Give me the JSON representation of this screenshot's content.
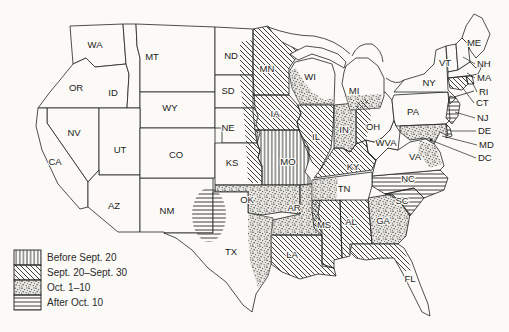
{
  "legend": {
    "items": [
      {
        "pattern": "vertical",
        "label": "Before Sept. 20"
      },
      {
        "pattern": "diagonal",
        "label": "Sept. 20–Sept. 30"
      },
      {
        "pattern": "stipple",
        "label": "Oct. 1–10"
      },
      {
        "pattern": "horizontal",
        "label": "After Oct. 10"
      }
    ]
  },
  "colors": {
    "line": "#222222",
    "paper": "#fbfaf7",
    "stipple_dot": "#3c3c3c"
  },
  "map": {
    "states": {
      "WA": {
        "label": "WA",
        "pattern": "none"
      },
      "OR": {
        "label": "OR",
        "pattern": "none"
      },
      "ID": {
        "label": "ID",
        "pattern": "none"
      },
      "MT": {
        "label": "MT",
        "pattern": "none"
      },
      "WY": {
        "label": "WY",
        "pattern": "none"
      },
      "NV": {
        "label": "NV",
        "pattern": "none"
      },
      "UT": {
        "label": "UT",
        "pattern": "none"
      },
      "CA": {
        "label": "CA",
        "pattern": "none"
      },
      "AZ": {
        "label": "AZ",
        "pattern": "none"
      },
      "NM": {
        "label": "NM",
        "pattern": "none"
      },
      "CO": {
        "label": "CO",
        "pattern": "none"
      },
      "ND": {
        "label": "ND",
        "pattern": "none"
      },
      "SD": {
        "label": "SD",
        "pattern": "none"
      },
      "NE": {
        "label": "NE",
        "pattern": "none"
      },
      "KS": {
        "label": "KS",
        "pattern": "none"
      },
      "MO": {
        "label": "MO",
        "pattern": "vertical"
      },
      "OK": {
        "label": "OK",
        "pattern": "stipple"
      },
      "AR": {
        "label": "AR",
        "pattern": "stipple"
      },
      "TX": {
        "label": "TX",
        "pattern": "none"
      },
      "LA": {
        "label": "LA",
        "pattern": "diagonal"
      },
      "MS": {
        "label": "MS",
        "pattern": "diagonal"
      },
      "AL": {
        "label": "AL",
        "pattern": "diagonal"
      },
      "GA": {
        "label": "GA",
        "pattern": "stipple"
      },
      "FL": {
        "label": "FL",
        "pattern": "none"
      },
      "SC": {
        "label": "SC",
        "pattern": "horizontal"
      },
      "NC": {
        "label": "NC",
        "pattern": "horizontal"
      },
      "VA": {
        "label": "VA",
        "pattern": "none"
      },
      "WVA": {
        "label": "WVA",
        "pattern": "none"
      },
      "KY": {
        "label": "KY",
        "pattern": "diagonal"
      },
      "TN": {
        "label": "TN",
        "pattern": "none"
      },
      "OH": {
        "label": "OH",
        "pattern": "none"
      },
      "IN": {
        "label": "IN",
        "pattern": "stipple"
      },
      "IL": {
        "label": "IL",
        "pattern": "diagonal"
      },
      "MI": {
        "label": "MI",
        "pattern": "none"
      },
      "WI": {
        "label": "WI",
        "pattern": "none"
      },
      "IA": {
        "label": "IA",
        "pattern": "diagonal"
      },
      "MN": {
        "label": "MN",
        "pattern": "diagonal"
      },
      "PA": {
        "label": "PA",
        "pattern": "none"
      },
      "NY": {
        "label": "NY",
        "pattern": "none"
      },
      "ME": {
        "label": "ME",
        "pattern": "none"
      },
      "VT": {
        "label": "VT",
        "pattern": "none"
      },
      "NH": {
        "label": "NH",
        "pattern": "none"
      },
      "MA": {
        "label": "MA",
        "pattern": "none"
      },
      "RI": {
        "label": "RI",
        "pattern": "diagonal"
      },
      "CT": {
        "label": "CT",
        "pattern": "diagonal"
      },
      "NJ": {
        "label": "NJ",
        "pattern": "horizontal"
      },
      "DE": {
        "label": "DE",
        "pattern": "horizontal"
      },
      "MD": {
        "label": "MD",
        "pattern": "stipple"
      },
      "DC": {
        "label": "DC",
        "pattern": "none"
      }
    },
    "overlays": {
      "dakotas_east": {
        "pattern": "diagonal"
      },
      "kansas_east": {
        "pattern": "diagonal"
      },
      "wisconsin_band": {
        "pattern": "stipple"
      },
      "michigan_band": {
        "pattern": "stipple"
      },
      "ohio_west": {
        "pattern": "diagonal"
      },
      "tennessee_west": {
        "pattern": "stipple"
      },
      "virginia_east": {
        "pattern": "stipple"
      },
      "texas_panhandle": {
        "pattern": "horizontal"
      },
      "texas_east": {
        "pattern": "stipple"
      },
      "florida_north": {
        "pattern": "diagonal"
      }
    }
  }
}
